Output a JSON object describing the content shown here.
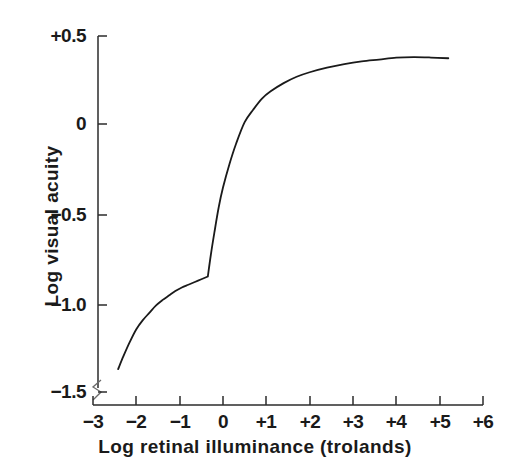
{
  "chart_data": {
    "type": "line",
    "title": "",
    "xlabel": "Log retinal illuminance (trolands)",
    "ylabel": "Log visual acuity",
    "xlim": [
      -3,
      6
    ],
    "ylim": [
      -1.5,
      0.5
    ],
    "grid": false,
    "legend": null,
    "xticks": [
      -3,
      -2,
      -1,
      0,
      1,
      2,
      3,
      4,
      5,
      6
    ],
    "xtick_labels": [
      "−3",
      "−2",
      "−1",
      "0",
      "+1",
      "+2",
      "+3",
      "+4",
      "+5",
      "+6"
    ],
    "yticks": [
      0.5,
      0,
      -0.5,
      -1.0,
      -1.5
    ],
    "ytick_labels": [
      "+0.5",
      "0",
      "−0.5",
      "−1.0",
      "−1.5"
    ],
    "axis_break": "y-axis broken below -1.5",
    "line_color": "#1a1a1a",
    "series": [
      {
        "name": "Visual acuity vs retinal illuminance",
        "points": [
          [
            -2.42,
            -1.35
          ],
          [
            -2.3,
            -1.28
          ],
          [
            -2.15,
            -1.2
          ],
          [
            -2.0,
            -1.13
          ],
          [
            -1.85,
            -1.08
          ],
          [
            -1.7,
            -1.04
          ],
          [
            -1.55,
            -1.0
          ],
          [
            -1.4,
            -0.97
          ],
          [
            -1.25,
            -0.945
          ],
          [
            -1.1,
            -0.92
          ],
          [
            -0.95,
            -0.9
          ],
          [
            -0.8,
            -0.885
          ],
          [
            -0.65,
            -0.87
          ],
          [
            -0.5,
            -0.855
          ],
          [
            -0.35,
            -0.84
          ],
          [
            -0.28,
            -0.72
          ],
          [
            -0.2,
            -0.6
          ],
          [
            -0.1,
            -0.46
          ],
          [
            0.0,
            -0.35
          ],
          [
            0.15,
            -0.22
          ],
          [
            0.3,
            -0.11
          ],
          [
            0.5,
            0.01
          ],
          [
            0.7,
            0.08
          ],
          [
            0.9,
            0.14
          ],
          [
            1.1,
            0.18
          ],
          [
            1.4,
            0.225
          ],
          [
            1.7,
            0.26
          ],
          [
            2.0,
            0.285
          ],
          [
            2.4,
            0.31
          ],
          [
            2.8,
            0.33
          ],
          [
            3.2,
            0.345
          ],
          [
            3.6,
            0.355
          ],
          [
            4.0,
            0.365
          ],
          [
            4.4,
            0.368
          ],
          [
            4.8,
            0.366
          ],
          [
            5.2,
            0.362
          ]
        ]
      }
    ]
  },
  "axes": {
    "x_title": "Log retinal illuminance (trolands)",
    "y_title": "Log visual acuity",
    "x_tick_labels": [
      "−3",
      "−2",
      "−1",
      "0",
      "+1",
      "+2",
      "+3",
      "+4",
      "+5",
      "+6"
    ],
    "y_tick_labels": [
      "+0.5",
      "0",
      "−0.5",
      "−1.0",
      "−1.5"
    ]
  }
}
